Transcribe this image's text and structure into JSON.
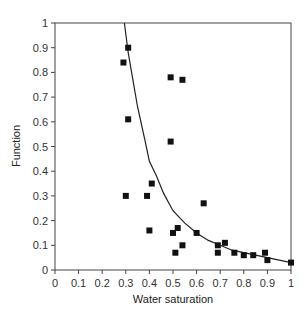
{
  "chart_data": {
    "type": "scatter",
    "title": "",
    "xlabel": "Water saturation",
    "ylabel": "Function",
    "xlim": [
      0,
      1
    ],
    "ylim": [
      0,
      1
    ],
    "grid": false,
    "legend": null,
    "x_ticks": [
      "0",
      "0.1",
      "0.2",
      "0.3",
      "0.4",
      "0.5",
      "0.6",
      "0.7",
      "0.8",
      "0.9",
      "1"
    ],
    "y_ticks": [
      "0",
      "0.1",
      "0.2",
      "0.3",
      "0.4",
      "0.5",
      "0.6",
      "0.7",
      "0.8",
      "0.9",
      "1"
    ],
    "series": [
      {
        "name": "Measured",
        "kind": "scatter",
        "marker": "square",
        "color": "#111111",
        "points": [
          [
            0.31,
            0.9
          ],
          [
            0.29,
            0.84
          ],
          [
            0.49,
            0.78
          ],
          [
            0.54,
            0.77
          ],
          [
            0.31,
            0.61
          ],
          [
            0.49,
            0.52
          ],
          [
            0.41,
            0.35
          ],
          [
            0.3,
            0.3
          ],
          [
            0.39,
            0.3
          ],
          [
            0.63,
            0.27
          ],
          [
            0.52,
            0.17
          ],
          [
            0.4,
            0.16
          ],
          [
            0.5,
            0.15
          ],
          [
            0.6,
            0.15
          ],
          [
            0.72,
            0.11
          ],
          [
            0.54,
            0.1
          ],
          [
            0.69,
            0.1
          ],
          [
            0.51,
            0.07
          ],
          [
            0.69,
            0.07
          ],
          [
            0.76,
            0.07
          ],
          [
            0.8,
            0.06
          ],
          [
            0.84,
            0.06
          ],
          [
            0.89,
            0.07
          ],
          [
            0.9,
            0.04
          ],
          [
            1.0,
            0.03
          ]
        ]
      },
      {
        "name": "Fitted curve",
        "kind": "line",
        "color": "#222222",
        "points": [
          [
            0.294,
            1.0
          ],
          [
            0.31,
            0.88
          ],
          [
            0.33,
            0.77
          ],
          [
            0.35,
            0.66
          ],
          [
            0.38,
            0.53
          ],
          [
            0.4,
            0.44
          ],
          [
            0.43,
            0.38
          ],
          [
            0.46,
            0.31
          ],
          [
            0.5,
            0.24
          ],
          [
            0.55,
            0.19
          ],
          [
            0.6,
            0.15
          ],
          [
            0.65,
            0.12
          ],
          [
            0.7,
            0.1
          ],
          [
            0.75,
            0.08
          ],
          [
            0.8,
            0.07
          ],
          [
            0.85,
            0.06
          ],
          [
            0.9,
            0.05
          ],
          [
            0.95,
            0.04
          ],
          [
            1.0,
            0.03
          ]
        ]
      }
    ]
  },
  "axes": {
    "x_label": "Water saturation",
    "y_label": "Function"
  }
}
